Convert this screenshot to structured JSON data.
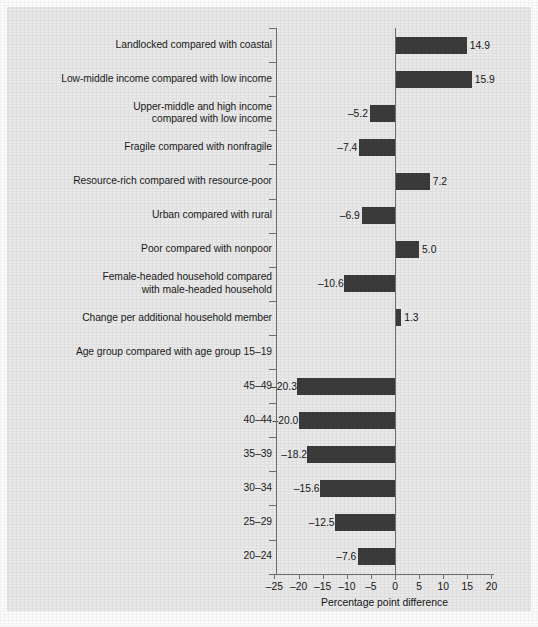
{
  "chart_data": {
    "type": "bar",
    "orientation": "horizontal",
    "title": "",
    "xlabel": "Percentage point difference",
    "ylabel": "",
    "xlim": [
      -25,
      20
    ],
    "xticks": [
      -25,
      -20,
      -15,
      -10,
      -5,
      0,
      5,
      10,
      15,
      20
    ],
    "xtick_labels": [
      "–25",
      "–20",
      "–15",
      "–10",
      "–5",
      "0",
      "5",
      "10",
      "15",
      "20"
    ],
    "grid": false,
    "legend": null,
    "bar_color": "#3b3b3b",
    "background_color": "#e9e9e9",
    "axis_color": "#6f6f6f",
    "categories": [
      "Landlocked compared with coastal",
      "Low-middle income compared with low income",
      "Upper-middle and high income compared with low income",
      "Fragile compared with nonfragile",
      "Resource-rich compared with resource-poor",
      "Urban compared with rural",
      "Poor compared with nonpoor",
      "Female-headed household compared with male-headed household",
      "Change per additional household member",
      "Age group compared with age group 15–19",
      "45–49",
      "40–44",
      "35–39",
      "30–34",
      "25–29",
      "20–24"
    ],
    "values": [
      14.9,
      15.9,
      -5.2,
      -7.4,
      7.2,
      -6.9,
      5.0,
      -10.6,
      1.3,
      null,
      -20.3,
      -20.0,
      -18.2,
      -15.6,
      -12.5,
      -7.6
    ],
    "value_labels": [
      "14.9",
      "15.9",
      "–5.2",
      "–7.4",
      "7.2",
      "–6.9",
      "5.0",
      "–10.6",
      "1.3",
      "",
      "–20.3",
      "–20.0",
      "–18.2",
      "–15.6",
      "–12.5",
      "–7.6"
    ]
  },
  "rows": [
    {
      "label_line1": "Landlocked compared with coastal",
      "label_line2": "",
      "value_label": "14.9"
    },
    {
      "label_line1": "Low-middle income compared with low income",
      "label_line2": "",
      "value_label": "15.9"
    },
    {
      "label_line1": "Upper-middle and high income",
      "label_line2": "compared with low income",
      "value_label": "–5.2"
    },
    {
      "label_line1": "Fragile compared with nonfragile",
      "label_line2": "",
      "value_label": "–7.4"
    },
    {
      "label_line1": "Resource-rich compared with resource-poor",
      "label_line2": "",
      "value_label": "7.2"
    },
    {
      "label_line1": "Urban compared with rural",
      "label_line2": "",
      "value_label": "–6.9"
    },
    {
      "label_line1": "Poor compared with nonpoor",
      "label_line2": "",
      "value_label": "5.0"
    },
    {
      "label_line1": "Female-headed household compared",
      "label_line2": "with male-headed household",
      "value_label": "–10.6"
    },
    {
      "label_line1": "Change per additional household member",
      "label_line2": "",
      "value_label": "1.3"
    },
    {
      "label_line1": "Age group compared with age group 15–19",
      "label_line2": "",
      "value_label": ""
    },
    {
      "label_line1": "45–49",
      "label_line2": "",
      "value_label": "–20.3"
    },
    {
      "label_line1": "40–44",
      "label_line2": "",
      "value_label": "–20.0"
    },
    {
      "label_line1": "35–39",
      "label_line2": "",
      "value_label": "–18.2"
    },
    {
      "label_line1": "30–34",
      "label_line2": "",
      "value_label": "–15.6"
    },
    {
      "label_line1": "25–29",
      "label_line2": "",
      "value_label": "–12.5"
    },
    {
      "label_line1": "20–24",
      "label_line2": "",
      "value_label": "–7.6"
    }
  ],
  "axis": {
    "x_title": "Percentage point difference"
  }
}
